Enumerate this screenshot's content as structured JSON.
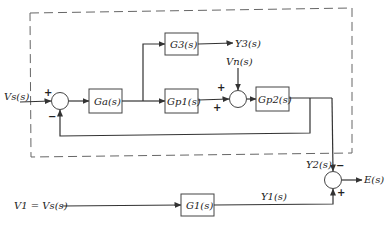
{
  "diagram": {
    "type": "block-diagram",
    "boundary": {
      "style": "dashed"
    },
    "inputs": {
      "vs": "Vs(s)",
      "v1": "V1 = Vs(s)",
      "vn": "Vn(s)"
    },
    "outputs": {
      "y3": "Y3(s)",
      "y2": "Y2(s)",
      "y1": "Y1(s)",
      "e": "E(s)"
    },
    "blocks": {
      "ga": "Ga(s)",
      "g3": "G3(s)",
      "gp1": "Gp1(s)",
      "gp2": "Gp2(s)",
      "g1": "G1(s)"
    },
    "summing_junctions": {
      "sum1": {
        "top_left_sign": "+",
        "bottom_sign": "−"
      },
      "sum2": {
        "top_sign": "+",
        "left_sign": "+"
      },
      "sum3": {
        "top_sign": "−",
        "bottom_sign": "+"
      }
    }
  }
}
